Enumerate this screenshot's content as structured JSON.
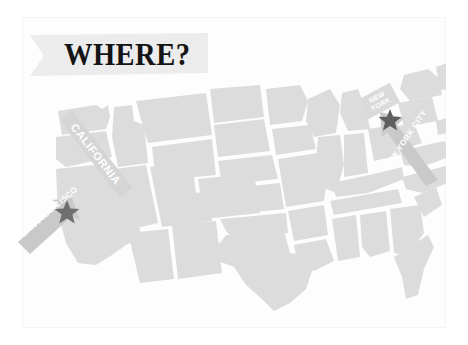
{
  "slide": {
    "title": "WHERE?",
    "background_color": "#ffffff",
    "frame_color": "#f4f4f4"
  },
  "title_banner": {
    "label": "WHERE?",
    "ribbon_color": "#ececec",
    "text_color": "#141414",
    "icon": "ribbon-banner-shape"
  },
  "map": {
    "name": "united-states-map",
    "state_fill": "#dcdcdc",
    "state_fill_alt": "#e2e2e2",
    "background": "#fbfbfb"
  },
  "markers": [
    {
      "id": "san-francisco",
      "state_label": "CALIFORNIA",
      "city_label": "SAN FRANCISCO",
      "ribbon_color": "#d5d5d5",
      "arrow_color": "#c9c9c9",
      "star_color": "#6f6f6f",
      "label_text_color": "#ffffff"
    },
    {
      "id": "new-york-city",
      "state_label_line1": "NEW",
      "state_label_line2": "YORK",
      "city_label": "NEW YORK CITY",
      "ribbon_color": "#dadada",
      "arrow_color": "#c9c9c9",
      "star_color": "#5f5f5f",
      "label_text_color": "#ffffff"
    }
  ]
}
